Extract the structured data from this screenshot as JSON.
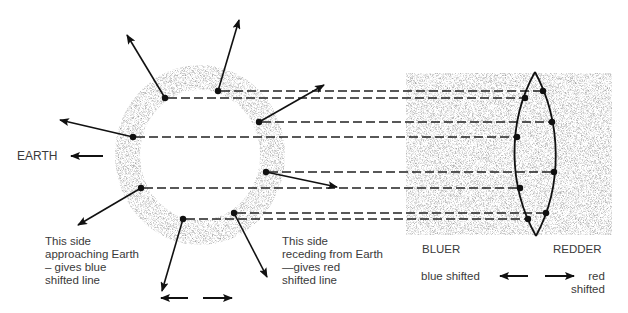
{
  "diagram": {
    "earth_label": "EARTH",
    "approaching_caption": [
      "This side",
      "approaching Earth",
      "– gives blue",
      "shifted line"
    ],
    "receding_caption": [
      "This side",
      "receding from Earth",
      "—gives red",
      "shifted line"
    ],
    "bluer_label": "BLUER",
    "redder_label": "REDDER",
    "blue_shifted_label": "blue shifted",
    "red_shifted_label": [
      "red",
      "shifted"
    ],
    "colors": {
      "ink": "#111111",
      "speckle": "#9a9a9a",
      "text": "#3a3a3a"
    },
    "ring": {
      "cx": 200,
      "cy": 155,
      "rx_outer": 85,
      "ry_outer": 90,
      "rx_inner": 60,
      "ry_inner": 65
    },
    "spectrum_box": {
      "x": 406,
      "y": 73,
      "w": 206,
      "h": 162
    },
    "lens": {
      "top": [
        535,
        72
      ],
      "bottom": [
        536,
        236
      ]
    },
    "emitters": [
      {
        "dot": [
          165,
          98
        ],
        "tip": [
          127,
          35
        ],
        "lens_dot": [
          525,
          98
        ]
      },
      {
        "dot": [
          218,
          91
        ],
        "tip": [
          239,
          20
        ],
        "lens_dot": [
          543,
          91
        ]
      },
      {
        "dot": [
          133,
          137
        ],
        "tip": [
          60,
          120
        ],
        "lens_dot": [
          517,
          137
        ]
      },
      {
        "dot": [
          259,
          122
        ],
        "tip": [
          324,
          85
        ],
        "lens_dot": [
          552,
          121
        ]
      },
      {
        "dot": [
          141,
          188
        ],
        "tip": [
          78,
          225
        ],
        "lens_dot": [
          520,
          188
        ]
      },
      {
        "dot": [
          266,
          172
        ],
        "tip": [
          337,
          187
        ],
        "lens_dot": [
          554,
          171
        ]
      },
      {
        "dot": [
          183,
          219
        ],
        "tip": [
          162,
          291
        ],
        "lens_dot": [
          528,
          218
        ]
      },
      {
        "dot": [
          234,
          213
        ],
        "tip": [
          267,
          277
        ],
        "lens_dot": [
          546,
          212
        ]
      }
    ]
  }
}
